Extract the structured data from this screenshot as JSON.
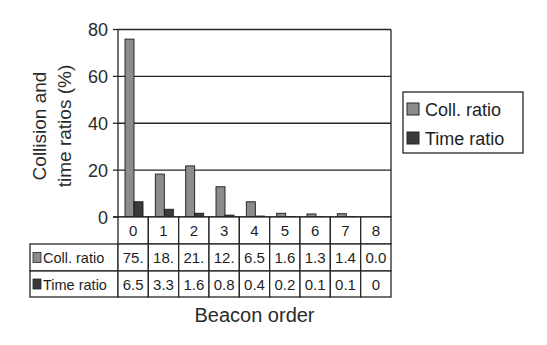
{
  "chart_data": {
    "type": "bar",
    "title": "",
    "xlabel": "Beacon order",
    "ylabel": "Collision and time ratios (%)",
    "ylabel_lines": [
      "Collision and",
      "time ratios (%)"
    ],
    "categories": [
      "0",
      "1",
      "2",
      "3",
      "4",
      "5",
      "6",
      "7",
      "8"
    ],
    "series": [
      {
        "name": "Coll. ratio",
        "values": [
          75.9,
          18.3,
          21.8,
          12.9,
          6.5,
          1.6,
          1.3,
          1.4,
          0.0
        ],
        "table_labels": [
          "75.",
          "18.",
          "21.",
          "12.",
          "6.5",
          "1.6",
          "1.3",
          "1.4",
          "0.0"
        ],
        "color": "#8c8c8c"
      },
      {
        "name": "Time ratio",
        "values": [
          6.5,
          3.3,
          1.6,
          0.8,
          0.4,
          0.2,
          0.1,
          0.1,
          0
        ],
        "table_labels": [
          "6.5",
          "3.3",
          "1.6",
          "0.8",
          "0.4",
          "0.2",
          "0.1",
          "0.1",
          "0"
        ],
        "color": "#3a3a3a"
      }
    ],
    "yticks": [
      0,
      20,
      40,
      60,
      80
    ],
    "ylim": [
      0,
      80
    ],
    "grid": true,
    "legend_position": "right",
    "data_table": true
  }
}
